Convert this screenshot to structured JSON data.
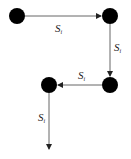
{
  "diagram": {
    "nodes": [
      {
        "id": "n1",
        "x": 17,
        "y": 16,
        "r": 8
      },
      {
        "id": "n2",
        "x": 110,
        "y": 16,
        "r": 8
      },
      {
        "id": "n3",
        "x": 110,
        "y": 85,
        "r": 8
      },
      {
        "id": "n4",
        "x": 49,
        "y": 85,
        "r": 8
      }
    ],
    "edges": [
      {
        "from": "n1",
        "to": "n2",
        "label": {
          "base": "S",
          "sub": "i"
        }
      },
      {
        "from": "n2",
        "to": "n3",
        "label": {
          "base": "S",
          "sub": "i"
        }
      },
      {
        "from": "n3",
        "to": "n4",
        "label": {
          "base": "S",
          "sub": "i"
        }
      },
      {
        "from": "n4",
        "to": "end",
        "label": {
          "base": "S",
          "sub": "i"
        }
      }
    ],
    "labels": {
      "e1_base": "S",
      "e1_sub": "i",
      "e2_base": "S",
      "e2_sub": "i",
      "e3_base": "S",
      "e3_sub": "i",
      "e4_base": "S",
      "e4_sub": "i"
    },
    "colors": {
      "node": "#000000",
      "edge": "#555555",
      "background": "#ffffff"
    }
  }
}
